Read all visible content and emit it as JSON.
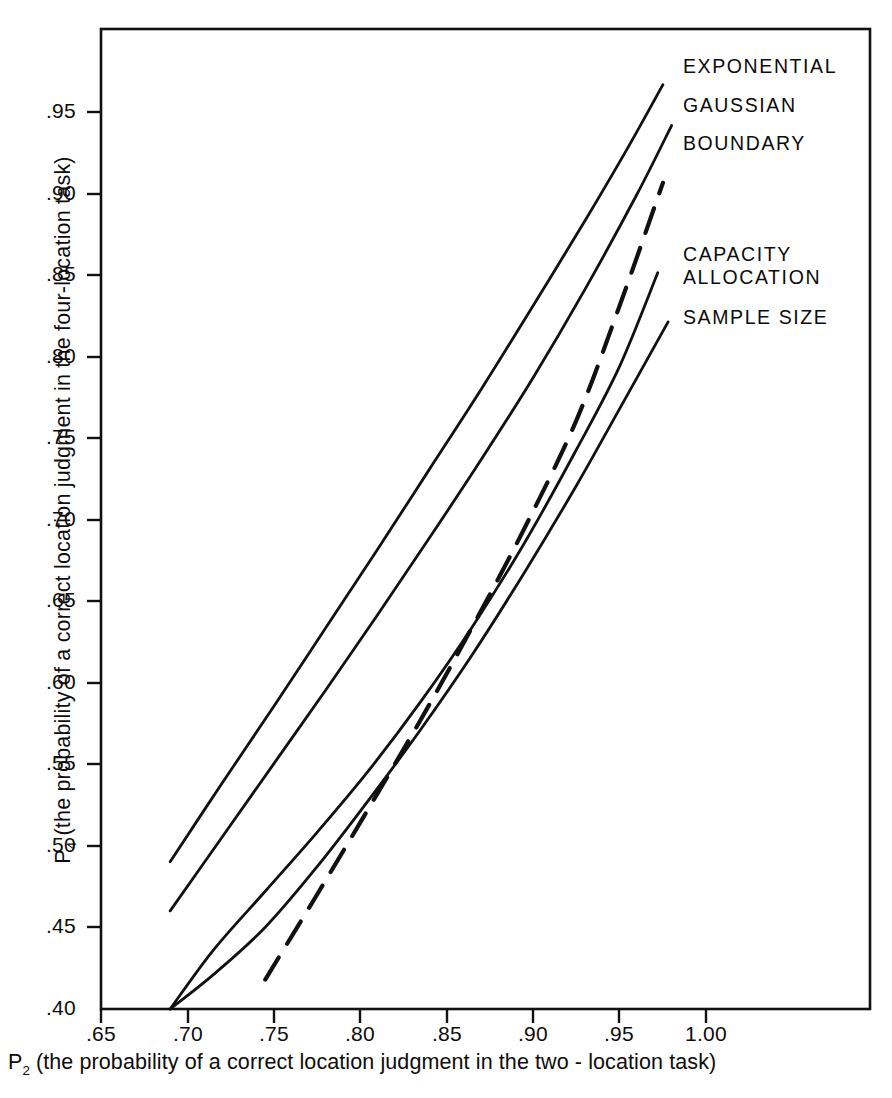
{
  "figure": {
    "background_color": "#ffffff",
    "line_color": "#111111",
    "axis_color": "#111111"
  },
  "axes": {
    "x_label_prefix": "P",
    "x_label_subscript": "2",
    "x_label_rest": " (the probability of a correct location judgment in the  two - location task)",
    "y_label_prefix": "P",
    "y_label_subscript": "4",
    "y_label_rest": " (the probability of a correct location judgment in the four-location task)",
    "x_ticks": [
      ".65",
      ".70",
      ".75",
      ".80",
      ".85",
      ".90",
      ".95",
      "1.00"
    ],
    "y_ticks": [
      ".95",
      ".90",
      ".85",
      ".80",
      ".75",
      ".70",
      ".65",
      ".60",
      ".55",
      ".50",
      ".45",
      ".40"
    ]
  },
  "legend": {
    "items": [
      {
        "label": "EXPONENTIAL",
        "style": "solid"
      },
      {
        "label": "GAUSSIAN",
        "style": "solid"
      },
      {
        "label": "BOUNDARY",
        "style": "dashed"
      },
      {
        "label": "CAPACITY\nALLOCATION",
        "style": "solid"
      },
      {
        "label": "SAMPLE SIZE",
        "style": "solid"
      }
    ]
  },
  "chart_data": {
    "type": "line",
    "title": "",
    "subtitle": "",
    "xlabel": "P2 (the probability of a correct location judgment in the two - location task)",
    "ylabel": "P4 (the probability of a correct location judgment in the four-location task)",
    "xlim": [
      0.65,
      1.005
    ],
    "ylim": [
      0.4,
      0.975
    ],
    "x_ticks": [
      0.65,
      0.7,
      0.75,
      0.8,
      0.85,
      0.9,
      0.95,
      1.0
    ],
    "y_ticks": [
      0.4,
      0.45,
      0.5,
      0.55,
      0.6,
      0.65,
      0.7,
      0.75,
      0.8,
      0.85,
      0.9,
      0.95
    ],
    "grid": false,
    "legend_position": "right-inside",
    "series": [
      {
        "name": "EXPONENTIAL",
        "style": "solid",
        "x": [
          0.69,
          0.72,
          0.75,
          0.78,
          0.81,
          0.84,
          0.87,
          0.9,
          0.93,
          0.955,
          0.975
        ],
        "y": [
          0.49,
          0.538,
          0.585,
          0.633,
          0.681,
          0.73,
          0.779,
          0.83,
          0.882,
          0.927,
          0.965
        ]
      },
      {
        "name": "GAUSSIAN",
        "style": "solid",
        "x": [
          0.69,
          0.72,
          0.75,
          0.78,
          0.81,
          0.84,
          0.87,
          0.9,
          0.93,
          0.96,
          0.98
        ],
        "y": [
          0.46,
          0.505,
          0.55,
          0.595,
          0.641,
          0.688,
          0.736,
          0.786,
          0.84,
          0.898,
          0.94
        ]
      },
      {
        "name": "BOUNDARY",
        "style": "dashed",
        "x": [
          0.745,
          0.775,
          0.805,
          0.835,
          0.865,
          0.895,
          0.925,
          0.95,
          0.975
        ],
        "y": [
          0.418,
          0.47,
          0.523,
          0.577,
          0.634,
          0.694,
          0.76,
          0.83,
          0.905
        ]
      },
      {
        "name": "CAPACITY ALLOCATION",
        "style": "solid",
        "x": [
          0.69,
          0.715,
          0.745,
          0.775,
          0.805,
          0.835,
          0.865,
          0.895,
          0.925,
          0.95,
          0.972
        ],
        "y": [
          0.4,
          0.436,
          0.472,
          0.508,
          0.546,
          0.588,
          0.634,
          0.685,
          0.742,
          0.793,
          0.85
        ]
      },
      {
        "name": "SAMPLE SIZE",
        "style": "solid",
        "x": [
          0.69,
          0.715,
          0.745,
          0.775,
          0.805,
          0.835,
          0.865,
          0.895,
          0.925,
          0.95,
          0.978
        ],
        "y": [
          0.4,
          0.421,
          0.45,
          0.487,
          0.528,
          0.571,
          0.617,
          0.667,
          0.72,
          0.767,
          0.82
        ]
      }
    ]
  }
}
